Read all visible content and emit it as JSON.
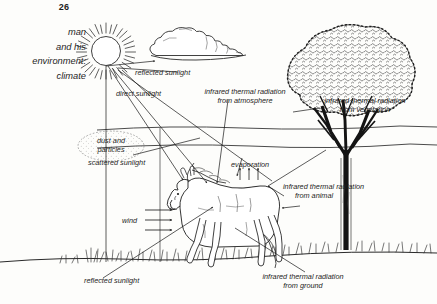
{
  "page": {
    "number": "26",
    "background_color": "#fdfdfb",
    "ink_color": "#1d1d1d"
  },
  "book_title": {
    "line1": "man",
    "line2": "and his",
    "line3": "environment:",
    "line4": "climate"
  },
  "figure": {
    "name": "earth-energy-balance-diagram",
    "elements": {
      "sun": "sun",
      "cloud": "cumulus-cloud",
      "tree": "broadleaf-tree",
      "animal": "horse",
      "ground": "grass-ground",
      "dust_cloud": "dust-particle-layer",
      "atmosphere_layers": 2
    }
  },
  "labels": {
    "reflected_sunlight_top": {
      "text": "reflected sunlight"
    },
    "direct_sunlight": {
      "text": "direct sunlight"
    },
    "infrared_atmosphere": {
      "line1": "infrared thermal radiation",
      "line2": "from atmosphere"
    },
    "infrared_vegetation": {
      "line1": "infrared thermal radiation",
      "line2": "from vegetation"
    },
    "dust_and_particles": {
      "line1": "dust and",
      "line2": "particles"
    },
    "scattered_sunlight": {
      "text": "scattered sunlight"
    },
    "evaporation": {
      "text": "evaporation"
    },
    "infrared_animal": {
      "line1": "infrared thermal radiation",
      "line2": "from animal"
    },
    "wind": {
      "text": "wind"
    },
    "reflected_sunlight_bottom": {
      "text": "reflected sunlight"
    },
    "infrared_ground": {
      "line1": "infrared thermal radiation",
      "line2": "from ground"
    }
  }
}
